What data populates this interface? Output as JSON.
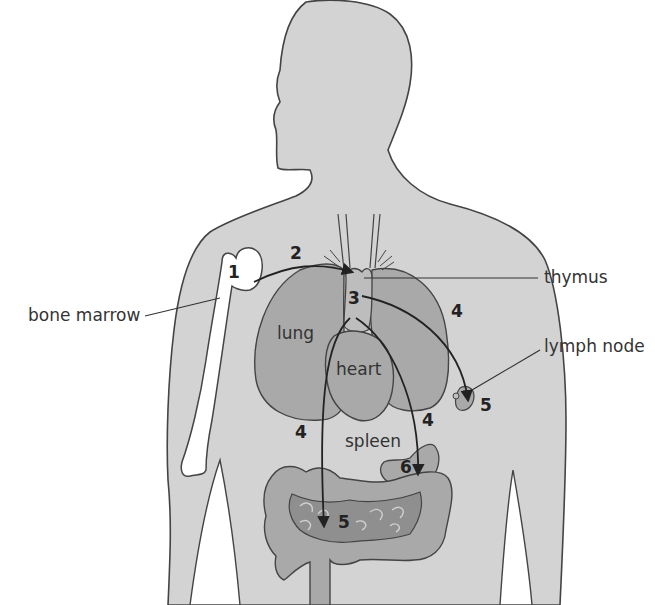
{
  "diagram": {
    "labels": {
      "bone_marrow": "bone marrow",
      "thymus": "thymus",
      "lymph_node": "lymph node",
      "lung": "lung",
      "heart": "heart",
      "spleen": "spleen"
    },
    "numbers": {
      "n1": "1",
      "n2": "2",
      "n3": "3",
      "n4_right_chest": "4",
      "n4_left_abdomen": "4",
      "n4_near_spleen": "4",
      "n5_lymph_node": "5",
      "n5_intestine": "5",
      "n6_spleen": "6"
    },
    "colors": {
      "body_fill": "#d3d3d3",
      "organ_fill": "#a9a9a9",
      "gut_dark": "#8f8f8f",
      "bone_fill": "#ffffff",
      "outline": "#444444"
    }
  }
}
